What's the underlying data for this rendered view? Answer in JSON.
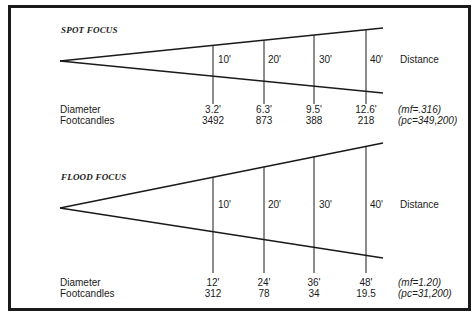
{
  "spot": {
    "title": "SPOT FOCUS",
    "distances": [
      "10'",
      "20'",
      "30'",
      "40'"
    ],
    "distance_label": "Distance",
    "diameter_label": "Diameter",
    "footcandles_label": "Footcandles",
    "diameters": [
      "3.2'",
      "6.3'",
      "9.5'",
      "12.6'"
    ],
    "footcandles": [
      "3492",
      "873",
      "388",
      "218"
    ],
    "mf": "(mf=.316)",
    "pc": "(pc=349,200)"
  },
  "flood": {
    "title": "FLOOD FOCUS",
    "distances": [
      "10'",
      "20'",
      "30'",
      "40'"
    ],
    "distance_label": "Distance",
    "diameter_label": "Diameter",
    "footcandles_label": "Footcandles",
    "diameters": [
      "12'",
      "24'",
      "36'",
      "48'"
    ],
    "footcandles": [
      "312",
      "78",
      "34",
      "19.5"
    ],
    "mf": "(mf=1.20)",
    "pc": "(pc=31,200)"
  }
}
